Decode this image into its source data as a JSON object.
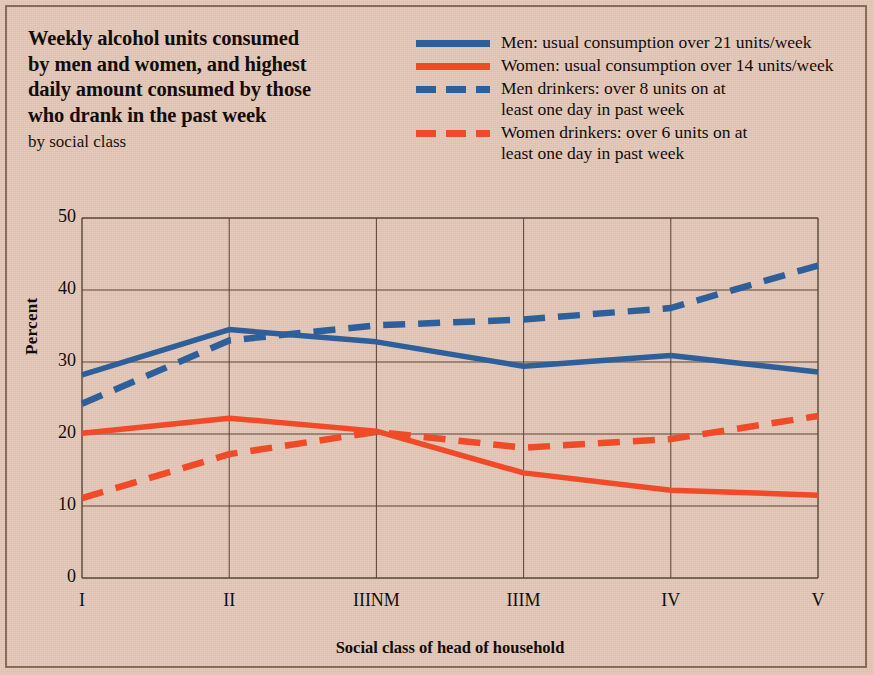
{
  "title": {
    "lines": [
      "Weekly alcohol units consumed",
      "by men and women, and highest",
      "daily amount consumed by those",
      "who drank in the past week"
    ],
    "subtitle": "by social class"
  },
  "legend": {
    "items": [
      {
        "label": "Men: usual consumption over 21 units/week",
        "style": "solid",
        "color": "#2d5f9a"
      },
      {
        "label": "Women: usual consumption over 14 units/week",
        "style": "solid",
        "color": "#f04a28"
      },
      {
        "label": "Men drinkers: over 8 units on at\nleast one day in past week",
        "style": "dashed",
        "color": "#2d5f9a"
      },
      {
        "label": "Women drinkers: over 6 units on at\nleast one day in past week",
        "style": "dashed",
        "color": "#f04a28"
      }
    ]
  },
  "colors": {
    "background": "#e3c6b6",
    "blue": "#2d5f9a",
    "red": "#f04a28",
    "axis": "#5a4436",
    "border": "#8d6a56",
    "text": "#120d09"
  },
  "chart_data": {
    "type": "line",
    "title": "Weekly alcohol units consumed by men and women, and highest daily amount consumed by those who drank in the past week",
    "subtitle": "by social class",
    "xlabel": "Social class of head of household",
    "ylabel": "Percent",
    "categories": [
      "I",
      "II",
      "IIINM",
      "IIIM",
      "IV",
      "V"
    ],
    "ylim": [
      0,
      50
    ],
    "yticks": [
      0,
      10,
      20,
      30,
      40,
      50
    ],
    "grid": true,
    "legend_position": "top-right",
    "series": [
      {
        "name": "Men: usual consumption over 21 units/week",
        "color": "#2d5f9a",
        "style": "solid",
        "values": [
          28.2,
          34.5,
          32.8,
          29.4,
          30.9,
          28.6
        ]
      },
      {
        "name": "Women: usual consumption over 14 units/week",
        "color": "#f04a28",
        "style": "solid",
        "values": [
          20.1,
          22.2,
          20.4,
          14.6,
          12.2,
          11.5
        ]
      },
      {
        "name": "Men drinkers: over 8 units on at least one day in past week",
        "color": "#2d5f9a",
        "style": "dashed",
        "values": [
          24.2,
          33.0,
          35.1,
          35.9,
          37.5,
          43.4
        ]
      },
      {
        "name": "Women drinkers: over 6 units on at least one day in past week",
        "color": "#f04a28",
        "style": "dashed",
        "values": [
          11.1,
          17.2,
          20.3,
          18.1,
          19.3,
          22.5
        ]
      }
    ]
  }
}
